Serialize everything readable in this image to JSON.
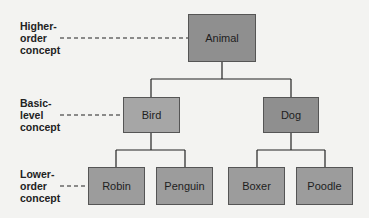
{
  "diagram": {
    "levels": [
      {
        "label": "Higher-\norder\nconcept"
      },
      {
        "label": "Basic-\nlevel\nconcept"
      },
      {
        "label": "Lower-\norder\nconcept"
      }
    ],
    "nodes": {
      "animal": "Animal",
      "bird": "Bird",
      "dog": "Dog",
      "robin": "Robin",
      "penguin": "Penguin",
      "boxer": "Boxer",
      "poodle": "Poodle"
    },
    "colors": {
      "higher": "#8f8f8f",
      "basic_bird": "#a6a6a6",
      "basic_dog": "#8f8f8f",
      "lower": "#9c9c9c",
      "line": "#222222"
    },
    "edges": [
      [
        "Animal",
        "Bird"
      ],
      [
        "Animal",
        "Dog"
      ],
      [
        "Bird",
        "Robin"
      ],
      [
        "Bird",
        "Penguin"
      ],
      [
        "Dog",
        "Boxer"
      ],
      [
        "Dog",
        "Poodle"
      ]
    ]
  }
}
